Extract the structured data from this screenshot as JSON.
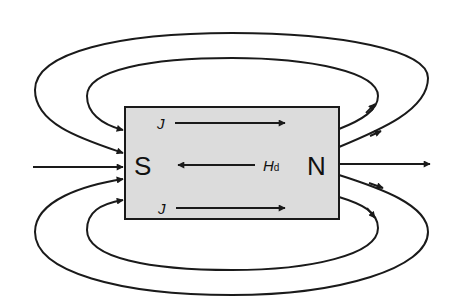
{
  "diagram": {
    "magnet": {
      "south_label": "S",
      "north_label": "N",
      "fill_color": "#dcdcdc",
      "stroke_color": "#1a1a1a"
    },
    "labels": {
      "j_top": "J",
      "j_bottom": "J",
      "hd_main": "H",
      "hd_sub": "d"
    },
    "arrows": {
      "j_top": "left-to-right",
      "j_bottom": "left-to-right",
      "hd": "right-to-left"
    },
    "field_lines": {
      "count": 5,
      "direction": "exit N, enter S",
      "color": "#1a1a1a"
    }
  }
}
